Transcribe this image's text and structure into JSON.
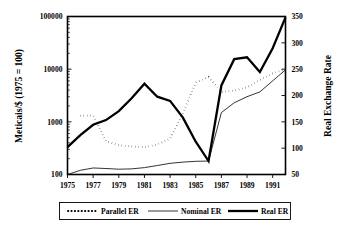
{
  "chart_data": {
    "type": "line",
    "title": "",
    "xlabel": "",
    "ylabel": "Meticais/$ (1975 = 100)",
    "y2label": "Real Exchange Rate",
    "grid": false,
    "legend_position": "bottom",
    "x": [
      1975,
      1976,
      1977,
      1978,
      1979,
      1980,
      1981,
      1982,
      1983,
      1984,
      1985,
      1986,
      1987,
      1988,
      1989,
      1990,
      1991,
      1992
    ],
    "xlim": [
      1975,
      1992
    ],
    "xticks": [
      1975,
      1977,
      1979,
      1981,
      1983,
      1985,
      1987,
      1989,
      1991
    ],
    "xtick_labels": [
      "1975",
      "1977",
      "1979",
      "1981",
      "1983",
      "1985",
      "1987",
      "1989",
      "1991"
    ],
    "yscale": "log",
    "ylim": [
      100,
      100000
    ],
    "yticks": [
      100,
      1000,
      10000,
      100000
    ],
    "ytick_labels": [
      "100",
      "1000",
      "10000",
      "100000"
    ],
    "y2lim": [
      50,
      350
    ],
    "y2ticks": [
      50,
      100,
      150,
      200,
      250,
      300,
      350
    ],
    "y2tick_labels": [
      "50",
      "100",
      "150",
      "200",
      "250",
      "300",
      "350"
    ],
    "series": [
      {
        "name": "Parallel ER",
        "style": "dotted",
        "axis": "left",
        "values": [
          null,
          1300,
          1320,
          430,
          360,
          340,
          330,
          370,
          480,
          1450,
          5600,
          7100,
          3700,
          3900,
          4500,
          6200,
          8300,
          10000
        ]
      },
      {
        "name": "Nominal ER",
        "style": "thin",
        "axis": "left",
        "values": [
          100,
          120,
          133,
          130,
          126,
          128,
          135,
          148,
          163,
          172,
          178,
          180,
          1500,
          2300,
          3000,
          3700,
          6000,
          9700
        ]
      },
      {
        "name": "Real ER",
        "style": "thick",
        "axis": "right",
        "values": [
          330,
          560,
          880,
          1080,
          1600,
          2800,
          5300,
          3000,
          2500,
          1200,
          420,
          180,
          4900,
          15500,
          16800,
          8800,
          25000,
          96000
        ]
      }
    ]
  },
  "legend": {
    "items": [
      {
        "label": "Parallel ER",
        "style": "dotted"
      },
      {
        "label": "Nominal ER",
        "style": "thin"
      },
      {
        "label": "Real ER",
        "style": "thick"
      }
    ]
  }
}
